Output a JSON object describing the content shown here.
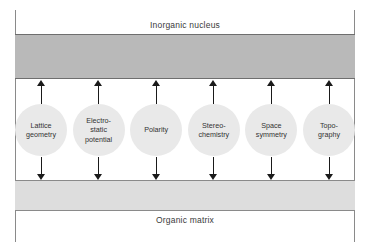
{
  "figure": {
    "top_band": {
      "label": "Inorganic nucleus",
      "fill_color": "#b9b9b9",
      "border_color": "#6e6e6e"
    },
    "bottom_band": {
      "label": "Organic matrix",
      "fill_color": "#dddddd",
      "border_color": "#8a8a8a"
    },
    "node_fill_color": "#e9e9e9",
    "arrow_color": "#1a1a1a",
    "nodes": [
      {
        "label": "Lattice\ngeometry"
      },
      {
        "label": "Electro-\nstatic\npotential"
      },
      {
        "label": "Polarity"
      },
      {
        "label": "Stereo-\nchemistry"
      },
      {
        "label": "Space\nsymmetry"
      },
      {
        "label": "Topo-\ngraphy"
      }
    ]
  }
}
